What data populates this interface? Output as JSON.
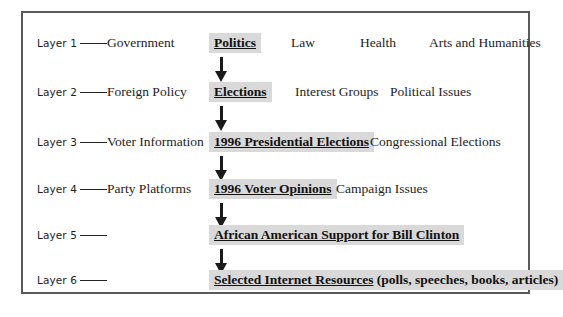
{
  "diagram": {
    "frame_border_color": "#5a5a5a",
    "highlight_color": "#d9d9d9",
    "arrow_color": "#1a1a1a",
    "layers": [
      {
        "tag": "Layer 1",
        "subtitle": "Government",
        "node": "Politics",
        "node_underlined": "Politics",
        "node_plain": "",
        "siblings": [
          "Law",
          "Health",
          "Arts and Humanities"
        ]
      },
      {
        "tag": "Layer 2",
        "subtitle": "Foreign Policy",
        "node": "Elections",
        "node_underlined": "Elections",
        "node_plain": "",
        "siblings": [
          "Interest Groups",
          "Political Issues"
        ]
      },
      {
        "tag": "Layer 3",
        "subtitle": "Voter Information",
        "node": "1996 Presidential Elections",
        "node_underlined": "1996 Presidential Elections",
        "node_plain": "",
        "siblings": [
          "Congressional Elections"
        ]
      },
      {
        "tag": "Layer 4",
        "subtitle": "Party Platforms",
        "node": "1996 Voter Opinions",
        "node_underlined": "1996 Voter Opinions",
        "node_plain": "",
        "siblings": [
          "Campaign Issues"
        ]
      },
      {
        "tag": "Layer 5",
        "subtitle": "",
        "node": "African American Support for Bill Clinton",
        "node_underlined": "African American Support for Bill Clinton",
        "node_plain": "",
        "siblings": []
      },
      {
        "tag": "Layer 6",
        "subtitle": "",
        "node": "Selected Internet Resources (polls, speeches, books, articles)",
        "node_underlined": "Selected Internet Resources",
        "node_plain": " (polls, speeches, books, articles)",
        "siblings": []
      }
    ],
    "arrows": [
      {
        "name": "arrow-layer1-to-layer2"
      },
      {
        "name": "arrow-layer2-to-layer3"
      },
      {
        "name": "arrow-layer3-to-layer4"
      },
      {
        "name": "arrow-layer4-to-layer5"
      },
      {
        "name": "arrow-layer5-to-layer6"
      }
    ]
  }
}
